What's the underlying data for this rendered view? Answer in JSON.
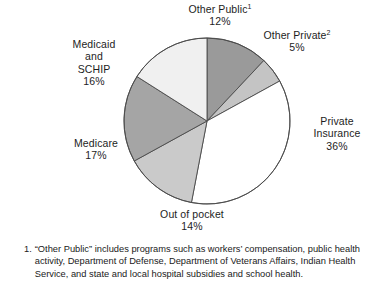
{
  "chart_data": {
    "type": "pie",
    "title": "",
    "subtitle": "",
    "xlabel": "",
    "ylabel": "",
    "legend_position": "none",
    "grid": false,
    "start_angle_deg": 0,
    "direction": "clockwise",
    "units": "percent",
    "total": 100,
    "categories": [
      "Other Public",
      "Other Private",
      "Private Insurance",
      "Out of pocket",
      "Medicare",
      "Medicaid and SCHIP"
    ],
    "values": [
      12,
      5,
      36,
      14,
      17,
      16
    ],
    "slices": [
      {
        "name": "Other Public",
        "label_lines": [
          "Other Public",
          "12%"
        ],
        "label_main": "Other Public",
        "footnote_marker": "1",
        "value": 12,
        "value_label": "12%",
        "color": "#9a9a9a"
      },
      {
        "name": "Other Private",
        "label_lines": [
          "Other Private",
          "5%"
        ],
        "label_main": "Other Private",
        "footnote_marker": "2",
        "value": 5,
        "value_label": "5%",
        "color": "#c4c4c4"
      },
      {
        "name": "Private Insurance",
        "label_lines": [
          "Private",
          "Insurance",
          "36%"
        ],
        "label_main": "Private Insurance",
        "footnote_marker": "",
        "value": 36,
        "value_label": "36%",
        "color": "#ffffff"
      },
      {
        "name": "Out of pocket",
        "label_lines": [
          "Out of pocket",
          "14%"
        ],
        "label_main": "Out of pocket",
        "footnote_marker": "",
        "value": 14,
        "value_label": "14%",
        "color": "#cacaca"
      },
      {
        "name": "Medicare",
        "label_lines": [
          "Medicare",
          "17%"
        ],
        "label_main": "Medicare",
        "footnote_marker": "",
        "value": 17,
        "value_label": "17%",
        "color": "#a5a5a5"
      },
      {
        "name": "Medicaid and SCHIP",
        "label_lines": [
          "Medicaid",
          "and",
          "SCHIP",
          "16%"
        ],
        "label_main": "Medicaid and SCHIP",
        "footnote_marker": "",
        "value": 16,
        "value_label": "16%",
        "color": "#f0f0f0"
      }
    ],
    "outline_color": "#4a4a4a"
  },
  "labels": {
    "other_public": {
      "line1": "Other Public",
      "sup": "1",
      "line2": "12%"
    },
    "other_private": {
      "line1": "Other Private",
      "sup": "2",
      "line2": "5%"
    },
    "private_insurance": {
      "line1": "Private",
      "line2": "Insurance",
      "line3": "36%"
    },
    "out_of_pocket": {
      "line1": "Out of pocket",
      "line2": "14%"
    },
    "medicare": {
      "line1": "Medicare",
      "line2": "17%"
    },
    "medicaid_schip": {
      "line1": "Medicaid",
      "line2": "and",
      "line3": "SCHIP",
      "line4": "16%"
    }
  },
  "footnotes": [
    {
      "marker": "1.",
      "text": "“Other Public” includes programs such as workers’ compensation, public health activity, Department of Defense, Department of Veterans Affairs, Indian Health Service, and state and local hospital subsidies and school health."
    }
  ]
}
